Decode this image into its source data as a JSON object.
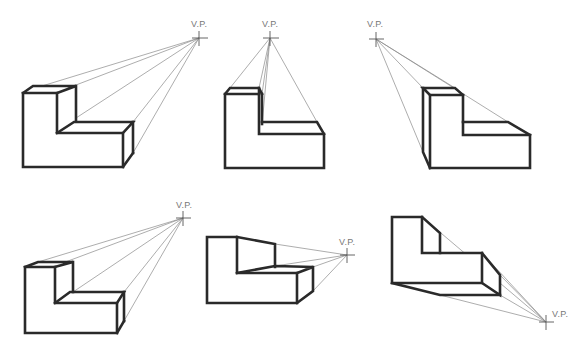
{
  "figure": {
    "vp_label": "V.P.",
    "colors": {
      "edge": "#2a2a2a",
      "projection": "#8a8a8a",
      "label": "#777777",
      "background": "#ffffff"
    }
  },
  "drawings": [
    {
      "id": 1,
      "vp": [
        199,
        38
      ],
      "vp_label": "V.P.",
      "position": "top-left"
    },
    {
      "id": 2,
      "vp": [
        270,
        38
      ],
      "vp_label": "V.P.",
      "position": "top-center"
    },
    {
      "id": 3,
      "vp": [
        376,
        39
      ],
      "vp_label": "V.P.",
      "position": "top-right"
    },
    {
      "id": 4,
      "vp": [
        183,
        218
      ],
      "vp_label": "V.P.",
      "position": "bottom-left"
    },
    {
      "id": 5,
      "vp": [
        347,
        255
      ],
      "vp_label": "V.P.",
      "position": "bottom-center"
    },
    {
      "id": 6,
      "vp": [
        546,
        322
      ],
      "vp_label": "V.P.",
      "position": "bottom-right"
    }
  ]
}
